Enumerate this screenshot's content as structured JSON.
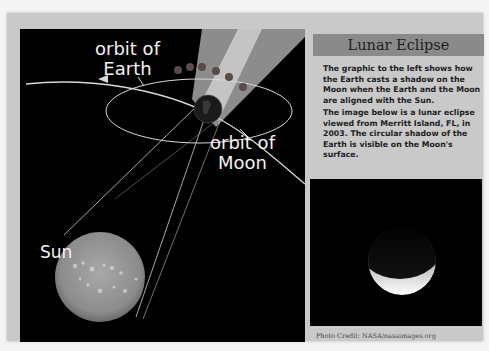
{
  "diagram": {
    "labels": {
      "orbit_earth_line1": "orbit of",
      "orbit_earth_line2": "Earth",
      "orbit_moon_line1": "orbit of",
      "orbit_moon_line2": "Moon",
      "sun": "Sun"
    },
    "colors": {
      "background": "#000000",
      "lines": "#d8d8d8",
      "shadow_penumbra": "#8c8c8c",
      "shadow_umbra": "#bdbdbd",
      "moon_phases": "#5a4a48"
    }
  },
  "panel": {
    "title": "Lunar Eclipse",
    "paragraph1": "The graphic to the left shows how the Earth casts a shadow on the Moon when the Earth and the Moon are aligned with the Sun.",
    "paragraph2": "The image below is a lunar eclipse viewed from Merritt Island, FL, in 2003. The circular shadow of the Earth is visible on the Moon's surface.",
    "photo_credit": "Photo Credit: NASA/nasaimages.org"
  }
}
